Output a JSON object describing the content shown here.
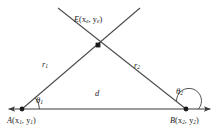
{
  "figure": {
    "name": "triangulation-diagram",
    "background_color": "#ffffff",
    "line_color": "#3b3b3b",
    "text_color": "#1a1a1a"
  },
  "labels": {
    "point_e": {
      "name": "E",
      "coords": "(x",
      "sub1": "e",
      "mid": ", y",
      "sub2": "e",
      "close": ")"
    },
    "point_a": {
      "name": "A",
      "coords": "(x",
      "sub1": "1",
      "mid": ", y",
      "sub2": "1",
      "close": ")"
    },
    "point_b": {
      "name": "B",
      "coords": "(x",
      "sub1": "2",
      "mid": ", y",
      "sub2": "2",
      "close": ")"
    },
    "segment_r1": {
      "name": "r",
      "sub": "1"
    },
    "segment_r2": {
      "name": "r",
      "sub": "2"
    },
    "segment_d": {
      "name": "d"
    },
    "angle_theta1": {
      "name": "θ",
      "sub": "1"
    },
    "angle_theta2": {
      "name": "θ",
      "sub": "2"
    }
  },
  "geometry": {
    "baseline": {
      "y": 109,
      "x_start": 8,
      "x_end": 211,
      "arrow_left": true,
      "arrow_right": true
    },
    "point_a": {
      "x": 22,
      "y": 109
    },
    "point_b": {
      "x": 186,
      "y": 109
    },
    "point_e": {
      "x": 98,
      "y": 45
    },
    "ray_from_a_end": {
      "x": 140,
      "y": 8
    },
    "ray_from_b_end": {
      "x": 58,
      "y": 8
    },
    "angle_arc_a_radius": 16,
    "angle_arc_b_radius": 13
  }
}
